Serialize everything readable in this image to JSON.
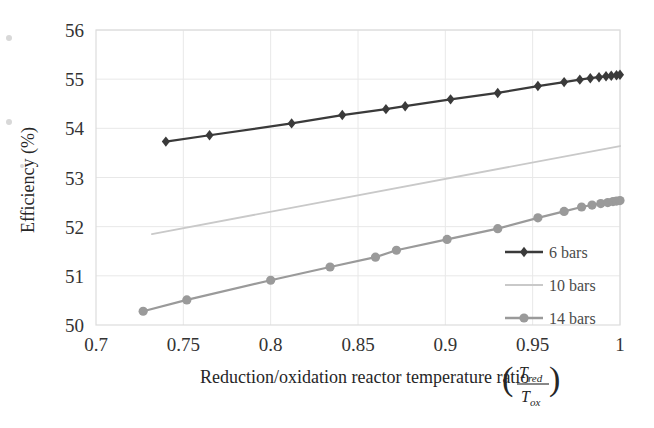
{
  "chart_data": {
    "type": "line",
    "title": "",
    "xlabel": "Reduction/oxidation reactor temperature ratio (T_red/T_ox)",
    "ylabel": "Efficiency (%)",
    "xlim": [
      0.7,
      1.0
    ],
    "ylim": [
      50,
      56
    ],
    "xticks": [
      "0.7",
      "0.75",
      "0.8",
      "0.85",
      "0.9",
      "0.95",
      "1"
    ],
    "xtick_values": [
      0.7,
      0.75,
      0.8,
      0.85,
      0.9,
      0.95,
      1.0
    ],
    "yticks": [
      "50",
      "51",
      "52",
      "53",
      "54",
      "55",
      "56"
    ],
    "ytick_values": [
      50,
      51,
      52,
      53,
      54,
      55,
      56
    ],
    "grid": true,
    "legend_position": "bottom-right",
    "series": [
      {
        "name": "6 bars",
        "color": "#3a3a3a",
        "marker": "diamond",
        "x": [
          0.74,
          0.765,
          0.812,
          0.841,
          0.866,
          0.877,
          0.903,
          0.93,
          0.953,
          0.968,
          0.977,
          0.983,
          0.988,
          0.992,
          0.995,
          0.998,
          1.0
        ],
        "y": [
          53.73,
          53.86,
          54.1,
          54.27,
          54.39,
          54.45,
          54.59,
          54.72,
          54.86,
          54.94,
          54.99,
          55.02,
          55.04,
          55.06,
          55.07,
          55.08,
          55.09
        ]
      },
      {
        "name": "10 bars",
        "color": "#c9c9c9",
        "marker": "none",
        "x": [
          0.732,
          1.0
        ],
        "y": [
          51.85,
          53.64
        ]
      },
      {
        "name": "14 bars",
        "color": "#9a9a9a",
        "marker": "circle",
        "x": [
          0.727,
          0.752,
          0.8,
          0.834,
          0.86,
          0.872,
          0.901,
          0.93,
          0.953,
          0.968,
          0.978,
          0.984,
          0.989,
          0.993,
          0.996,
          0.998,
          1.0
        ],
        "y": [
          50.28,
          50.51,
          50.91,
          51.18,
          51.38,
          51.52,
          51.74,
          51.96,
          52.18,
          52.31,
          52.4,
          52.44,
          52.47,
          52.49,
          52.51,
          52.52,
          52.53
        ]
      }
    ]
  },
  "axis": {
    "y_title": "Efficiency (%)",
    "x_title_text": "Reduction/oxidation reactor temperature ratio",
    "x_title_fraction": {
      "numerator": "T",
      "numerator_sub": "red",
      "denominator": "T",
      "denominator_sub": "ox",
      "left_paren": "(",
      "right_paren": ")"
    }
  },
  "legend": {
    "items": [
      {
        "label": "6 bars",
        "color": "#3a3a3a",
        "marker": "diamond"
      },
      {
        "label": "10 bars",
        "color": "#c9c9c9",
        "marker": "none"
      },
      {
        "label": "14 bars",
        "color": "#9a9a9a",
        "marker": "circle"
      }
    ]
  },
  "style": {
    "plot_background": "#ffffff",
    "grid_color": "#e8e8e8",
    "frame_color": "#dcdcdc",
    "axis_text_color": "#333333"
  }
}
